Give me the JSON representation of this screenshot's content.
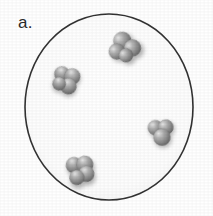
{
  "figure": {
    "panel_label": "a.",
    "caption_text": "",
    "background_color": "#ffffff",
    "ink_color": "#2b2b2b"
  },
  "container": {
    "name": "circular vessel outline",
    "shape": "circle",
    "center_x": 109,
    "center_y": 107,
    "radius_x": 84,
    "radius_y": 93,
    "stroke_color": "#333333",
    "stroke_width": 1.6,
    "fill_color": "#fdfdfd"
  },
  "particles": {
    "count": 4,
    "description": "space-filling molecule clusters",
    "sphere_color": "#8d8d8d",
    "sphere_highlight_color": "#d8d8d8",
    "sphere_shadow_color": "#5f5f5f",
    "items": [
      {
        "id": "molecule-1",
        "label": "top-right molecule",
        "cx": 124,
        "cy": 46,
        "scale": 1.0,
        "rotation": -18,
        "atoms": [
          {
            "dx": 0,
            "dy": -5.5,
            "r": 9.0
          },
          {
            "dx": -8.5,
            "dy": 3.0,
            "r": 8.0
          },
          {
            "dx": 7.5,
            "dy": 4.5,
            "r": 8.5
          },
          {
            "dx": -1.0,
            "dy": 9.5,
            "r": 7.0
          }
        ]
      },
      {
        "id": "molecule-2",
        "label": "upper-left molecule",
        "cx": 66,
        "cy": 80,
        "scale": 0.95,
        "rotation": 24,
        "atoms": [
          {
            "dx": -6.5,
            "dy": -4.0,
            "r": 8.0
          },
          {
            "dx": 4.5,
            "dy": -6.0,
            "r": 8.5
          },
          {
            "dx": 5.0,
            "dy": 5.0,
            "r": 8.5
          },
          {
            "dx": -5.0,
            "dy": 6.5,
            "r": 7.0
          }
        ]
      },
      {
        "id": "molecule-3",
        "label": "right molecule",
        "cx": 161,
        "cy": 132,
        "scale": 0.95,
        "rotation": -5,
        "atoms": [
          {
            "dx": -5.5,
            "dy": -5.0,
            "r": 8.0
          },
          {
            "dx": 5.5,
            "dy": -4.5,
            "r": 8.0
          },
          {
            "dx": 0.5,
            "dy": 5.5,
            "r": 9.0
          }
        ]
      },
      {
        "id": "molecule-4",
        "label": "bottom-left molecule",
        "cx": 80,
        "cy": 170,
        "scale": 1.0,
        "rotation": 12,
        "atoms": [
          {
            "dx": -7.0,
            "dy": -3.5,
            "r": 8.0
          },
          {
            "dx": 3.5,
            "dy": -6.5,
            "r": 8.5
          },
          {
            "dx": 7.0,
            "dy": 2.5,
            "r": 8.0
          },
          {
            "dx": -1.5,
            "dy": 8.0,
            "r": 7.5
          }
        ]
      }
    ]
  }
}
